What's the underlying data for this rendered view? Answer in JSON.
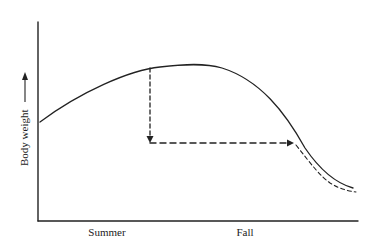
{
  "diagram": {
    "y_axis_label": "Body weight",
    "x_axis_labels": [
      "Summer",
      "Fall"
    ],
    "colors": {
      "ink": "#222222",
      "background": "#ffffff"
    },
    "elements": {
      "curve": "body weight rises through summer, peaks, then declines in fall",
      "dashed_drop": "dashed vertical arrow from curve down to lower level",
      "dashed_shift": "dashed horizontal arrow pointing right to where curve meets that level",
      "dashed_tail": "dashed curve paralleling the descending tail"
    }
  }
}
